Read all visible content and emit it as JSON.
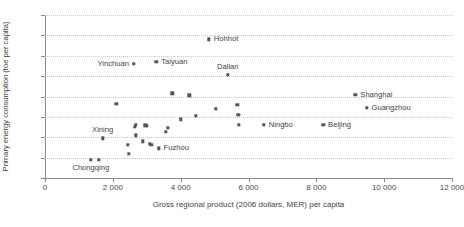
{
  "chart_data": {
    "type": "scatter",
    "title": "",
    "xlabel": "Gross regional product (2006 dollars, MER) per capita",
    "ylabel": "Primary energy consumption (toe per capita)",
    "xlim": [
      0,
      12000
    ],
    "ylim": [
      0,
      8
    ],
    "xticks": [
      0,
      2000,
      4000,
      6000,
      8000,
      10000,
      12000
    ],
    "xtick_labels": [
      "0",
      "2 000",
      "4 000",
      "6 000",
      "8 000",
      "10 000",
      "12 000"
    ],
    "yticks": [
      0,
      1,
      2,
      3,
      4,
      5,
      6,
      7,
      8
    ],
    "ytick_labels": [
      "0",
      "1",
      "2",
      "3",
      "4",
      "5",
      "6",
      "7",
      "8"
    ],
    "grid": "horizontal-dotted",
    "legend": "none",
    "marker_color": "#555555",
    "points": [
      {
        "label": "Chongqing",
        "x": 1350,
        "y": 0.9,
        "label_pos": "below"
      },
      {
        "label": "",
        "x": 1580,
        "y": 0.9,
        "label_pos": ""
      },
      {
        "label": "Xining",
        "x": 1700,
        "y": 1.95,
        "label_pos": "above"
      },
      {
        "label": "",
        "x": 2100,
        "y": 3.65,
        "label_pos": ""
      },
      {
        "label": "",
        "x": 2450,
        "y": 1.62,
        "label_pos": ""
      },
      {
        "label": "",
        "x": 2470,
        "y": 1.18,
        "label_pos": ""
      },
      {
        "label": "",
        "x": 2650,
        "y": 2.52,
        "label_pos": ""
      },
      {
        "label": "",
        "x": 2680,
        "y": 2.62,
        "label_pos": ""
      },
      {
        "label": "",
        "x": 2680,
        "y": 2.1,
        "label_pos": ""
      },
      {
        "label": "",
        "x": 2880,
        "y": 1.8,
        "label_pos": ""
      },
      {
        "label": "",
        "x": 2960,
        "y": 2.58,
        "label_pos": ""
      },
      {
        "label": "",
        "x": 3000,
        "y": 2.55,
        "label_pos": ""
      },
      {
        "label": "",
        "x": 3090,
        "y": 1.68,
        "label_pos": ""
      },
      {
        "label": "",
        "x": 3140,
        "y": 1.62,
        "label_pos": ""
      },
      {
        "label": "Fuzhou",
        "x": 3350,
        "y": 1.45,
        "label_pos": "right"
      },
      {
        "label": "",
        "x": 3560,
        "y": 2.28,
        "label_pos": ""
      },
      {
        "label": "",
        "x": 3620,
        "y": 2.45,
        "label_pos": ""
      },
      {
        "label": "Yinchuan",
        "x": 2620,
        "y": 5.6,
        "label_pos": "left"
      },
      {
        "label": "Taiyuan",
        "x": 3280,
        "y": 5.7,
        "label_pos": "right"
      },
      {
        "label": "",
        "x": 3750,
        "y": 4.15,
        "label_pos": ""
      },
      {
        "label": "",
        "x": 4250,
        "y": 4.05,
        "label_pos": ""
      },
      {
        "label": "",
        "x": 4000,
        "y": 2.88,
        "label_pos": ""
      },
      {
        "label": "",
        "x": 4450,
        "y": 3.05,
        "label_pos": ""
      },
      {
        "label": "Hohhot",
        "x": 4830,
        "y": 6.8,
        "label_pos": "right"
      },
      {
        "label": "Dalian",
        "x": 5390,
        "y": 5.05,
        "label_pos": "above"
      },
      {
        "label": "",
        "x": 5040,
        "y": 3.4,
        "label_pos": ""
      },
      {
        "label": "",
        "x": 5670,
        "y": 3.58,
        "label_pos": ""
      },
      {
        "label": "",
        "x": 5700,
        "y": 3.1,
        "label_pos": ""
      },
      {
        "label": "",
        "x": 5720,
        "y": 2.62,
        "label_pos": ""
      },
      {
        "label": "Ningbo",
        "x": 6450,
        "y": 2.62,
        "label_pos": "right"
      },
      {
        "label": "Beijing",
        "x": 8200,
        "y": 2.62,
        "label_pos": "right"
      },
      {
        "label": "Shanghai",
        "x": 9150,
        "y": 4.08,
        "label_pos": "right"
      },
      {
        "label": "Guangzhou",
        "x": 9480,
        "y": 3.45,
        "label_pos": "right"
      }
    ]
  }
}
